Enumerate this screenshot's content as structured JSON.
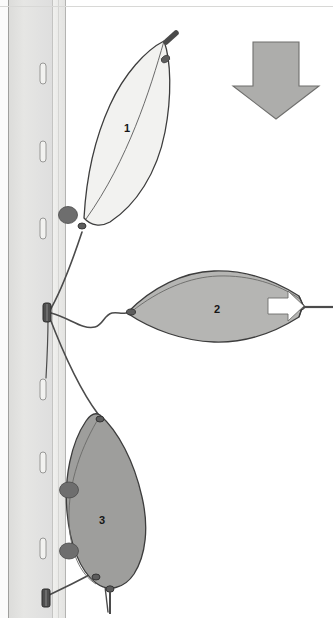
{
  "figure": {
    "name": "mechanical-rail-leaf-diagram",
    "width": 333,
    "height": 618,
    "background": "#ffffff"
  },
  "colors": {
    "background": "#ffffff",
    "wall_panel": "#e3e3e1",
    "wall_panel_edge": "#d2d2d0",
    "rail_strip": "#ececea",
    "rail_line": "#b9b9b7",
    "slot_fill": "#f2f2f0",
    "slot_stroke": "#9a9a98",
    "shape1_fill": "#f2f2f0",
    "shape2_fill": "#b5b5b3",
    "shape3_fill": "#9e9e9c",
    "arrow_fill": "#adadab",
    "outline": "#3d3d3d",
    "knob_fill": "#6e6e6e",
    "knob_stroke": "#4a4a4a",
    "pin_fill": "#5a5a5a",
    "white_arrow": "#ffffff",
    "label_text": "#161616"
  },
  "labels": [
    {
      "id": "label-1",
      "text": "1",
      "x": 124,
      "y": 123
    },
    {
      "id": "label-2",
      "text": "2",
      "x": 214,
      "y": 304
    },
    {
      "id": "label-3",
      "text": "3",
      "x": 99,
      "y": 515
    }
  ],
  "wall": {
    "name": "vertical-wall-rail",
    "panel_x": 10,
    "panel_width": 48,
    "strip_x": 50,
    "strip_width": 16,
    "slot_count": 8,
    "slots_y": [
      62,
      140,
      218,
      380,
      452,
      540
    ],
    "slot_width": 6,
    "slot_height": 20
  },
  "shapes": [
    {
      "id": "shape-1",
      "label": "1",
      "fill": "#f2f2f0",
      "description": "light elongated leaf tilted upper area"
    },
    {
      "id": "shape-2",
      "label": "2",
      "fill": "#b5b5b3",
      "description": "mid grey horizontal lens mid-right"
    },
    {
      "id": "shape-3",
      "label": "3",
      "fill": "#9e9e9c",
      "description": "dark grey vertical leaf lower left"
    }
  ],
  "arrows": {
    "down_arrow": {
      "id": "down-arrow",
      "fill": "#adadab",
      "direction": "down",
      "x": 233,
      "y": 40,
      "width": 86,
      "height": 78
    },
    "inner_right_arrow": {
      "id": "inner-right-arrow",
      "fill": "#ffffff",
      "direction": "right",
      "x": 268,
      "y": 290,
      "width": 36,
      "height": 28
    }
  },
  "knobs": [
    {
      "id": "knob-1",
      "cx": 68,
      "cy": 215,
      "rx": 9,
      "ry": 8
    },
    {
      "id": "knob-2",
      "cx": 68,
      "cy": 489,
      "rx": 9,
      "ry": 8
    },
    {
      "id": "knob-3",
      "cx": 68,
      "cy": 551,
      "rx": 9,
      "ry": 8
    }
  ],
  "anchor": {
    "id": "wall-anchor-clip",
    "x": 44,
    "y": 306,
    "width": 9,
    "height": 18
  }
}
